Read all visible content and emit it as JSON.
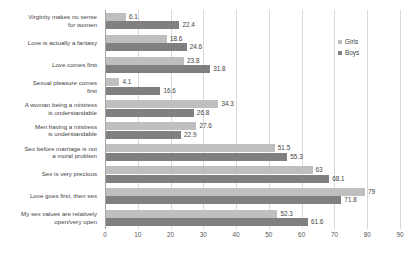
{
  "chart_data": {
    "type": "bar",
    "orientation": "horizontal",
    "title": "",
    "xlabel": "",
    "ylabel": "",
    "xlim": [
      0,
      90
    ],
    "xticks": [
      0,
      10,
      20,
      30,
      40,
      50,
      60,
      70,
      80,
      90
    ],
    "grid": true,
    "legend_position": "top-right",
    "categories": [
      "Virginity makes no sense for women",
      "Love is actually a fantasy",
      "Love comes first",
      "Sexual pleasure comes first",
      "A woman being a mistress is understandable",
      "Men having a mistress is understandable",
      "Sex before marriage is not a moral problem",
      "Sex is very precious",
      "Love goes first, then sex",
      "My sex values are relatively open/very open"
    ],
    "category_lines": [
      [
        "Virginity makes no sense",
        "for women"
      ],
      [
        "Love is actually a fantasy"
      ],
      [
        "Love comes first"
      ],
      [
        "Sexual pleasure comes",
        "first"
      ],
      [
        "A woman being a mistress",
        "is understandable"
      ],
      [
        "Men having a mistress",
        "is understandable"
      ],
      [
        "Sex before marriage is not",
        "a moral problem"
      ],
      [
        "Sex is very precious"
      ],
      [
        "Love goes first, then sex"
      ],
      [
        "My sex values are relatively",
        "open/very open"
      ]
    ],
    "series": [
      {
        "name": "Girls",
        "color": "#bfbfbf",
        "values": [
          6.1,
          18.6,
          23.8,
          4.1,
          34.3,
          27.6,
          51.5,
          63,
          79,
          52.3
        ],
        "labels": [
          "6.1",
          "18.6",
          "23.8",
          "4.1",
          "34.3",
          "27.6",
          "51.5",
          "63",
          "79",
          "52.3"
        ]
      },
      {
        "name": "Boys",
        "color": "#808080",
        "values": [
          22.4,
          24.6,
          31.8,
          16.6,
          26.8,
          22.9,
          55.3,
          68.1,
          71.8,
          61.6
        ],
        "labels": [
          "22.4",
          "24.6",
          "31.8",
          "16.6",
          "26.8",
          "22.9",
          "55.3",
          "68.1",
          "71.8",
          "61.6"
        ]
      }
    ]
  },
  "legend": {
    "items": [
      {
        "label": "Girls",
        "swatch": "girls"
      },
      {
        "label": "Boys",
        "swatch": "boys"
      }
    ]
  }
}
